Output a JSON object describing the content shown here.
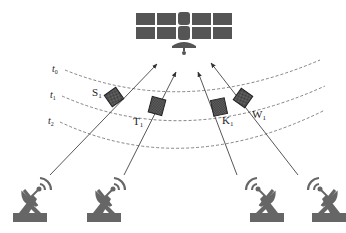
{
  "diagram": {
    "satellite": {
      "name": "satellite"
    },
    "time_labels": [
      {
        "id": "t0",
        "text": "t",
        "sub": "0"
      },
      {
        "id": "t1",
        "text": "t",
        "sub": "1"
      },
      {
        "id": "t2",
        "text": "t",
        "sub": "2"
      }
    ],
    "objects": [
      {
        "id": "S1",
        "text": "S",
        "sub": "1"
      },
      {
        "id": "T1",
        "text": "T",
        "sub": "1"
      },
      {
        "id": "K1",
        "text": "K",
        "sub": "1"
      },
      {
        "id": "W1",
        "text": "W",
        "sub": "1"
      }
    ],
    "ground_stations": [
      {
        "id": "gs1",
        "orientation": "right"
      },
      {
        "id": "gs2",
        "orientation": "right"
      },
      {
        "id": "gs3",
        "orientation": "left"
      },
      {
        "id": "gs4",
        "orientation": "left"
      }
    ],
    "colors": {
      "icon": "#555555",
      "box": "#4a4a4a",
      "line": "#444444",
      "dashed": "#666666"
    }
  }
}
